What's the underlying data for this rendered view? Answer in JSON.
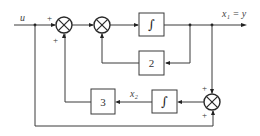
{
  "diagram": {
    "type": "block-diagram",
    "input_label": "u",
    "output_label": "x₁ = y",
    "state_label_2": "x₂",
    "blocks": [
      {
        "id": "integrator-1",
        "label": "∫"
      },
      {
        "id": "gain-2",
        "label": "2"
      },
      {
        "id": "integrator-2",
        "label": "∫"
      },
      {
        "id": "gain-3",
        "label": "3"
      }
    ],
    "summers": [
      {
        "id": "summer-1",
        "signs": [
          "+",
          "+"
        ]
      },
      {
        "id": "summer-2",
        "signs": []
      },
      {
        "id": "summer-3",
        "signs": [
          "+",
          "+"
        ]
      }
    ],
    "colors": {
      "line": "#3a3a3a",
      "background": "#ffffff"
    }
  }
}
